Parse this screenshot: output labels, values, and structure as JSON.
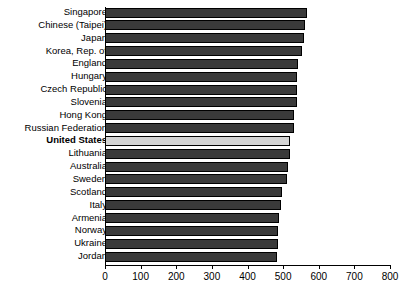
{
  "chart_data": {
    "type": "bar",
    "orientation": "horizontal",
    "title": "",
    "subtitle": "",
    "xlabel": "",
    "ylabel": "",
    "xlim": [
      0,
      800
    ],
    "xticks": [
      0,
      100,
      200,
      300,
      400,
      500,
      600,
      700,
      800
    ],
    "xtick_labels": [
      "0",
      "100",
      "200",
      "300",
      "400",
      "500",
      "600",
      "700",
      "800"
    ],
    "grid": false,
    "legend": null,
    "highlight_category": "United States",
    "colors": {
      "bar": "#3a3a3a",
      "bar_edge": "#000000",
      "highlight_bar": "#d4d4d4",
      "axis": "#000000",
      "background": "#ffffff"
    },
    "categories": [
      "Singapore",
      "Chinese (Taipei)",
      "Japan",
      "Korea, Rep. of",
      "England",
      "Hungary",
      "Czech Republic",
      "Slovenia",
      "Hong Kong",
      "Russian Federation",
      "United States",
      "Lithuania",
      "Australia",
      "Sweden",
      "Scotland",
      "Italy",
      "Armenia",
      "Norway",
      "Ukraine",
      "Jordan"
    ],
    "values": [
      567,
      561,
      558,
      553,
      542,
      539,
      539,
      538,
      530,
      530,
      520,
      519,
      515,
      511,
      496,
      495,
      488,
      487,
      485,
      482
    ]
  },
  "rows": [
    {
      "label": "Singapore",
      "value": 567,
      "highlight": false
    },
    {
      "label": "Chinese (Taipei)",
      "value": 561,
      "highlight": false
    },
    {
      "label": "Japan",
      "value": 558,
      "highlight": false
    },
    {
      "label": "Korea, Rep. of",
      "value": 553,
      "highlight": false
    },
    {
      "label": "England",
      "value": 542,
      "highlight": false
    },
    {
      "label": "Hungary",
      "value": 539,
      "highlight": false
    },
    {
      "label": "Czech Republic",
      "value": 539,
      "highlight": false
    },
    {
      "label": "Slovenia",
      "value": 538,
      "highlight": false
    },
    {
      "label": "Hong Kong",
      "value": 530,
      "highlight": false
    },
    {
      "label": "Russian Federation",
      "value": 530,
      "highlight": false
    },
    {
      "label": "United States",
      "value": 520,
      "highlight": true
    },
    {
      "label": "Lithuania",
      "value": 519,
      "highlight": false
    },
    {
      "label": "Australia",
      "value": 515,
      "highlight": false
    },
    {
      "label": "Sweden",
      "value": 511,
      "highlight": false
    },
    {
      "label": "Scotland",
      "value": 496,
      "highlight": false
    },
    {
      "label": "Italy",
      "value": 495,
      "highlight": false
    },
    {
      "label": "Armenia",
      "value": 488,
      "highlight": false
    },
    {
      "label": "Norway",
      "value": 487,
      "highlight": false
    },
    {
      "label": "Ukraine",
      "value": 485,
      "highlight": false
    },
    {
      "label": "Jordan",
      "value": 482,
      "highlight": false
    }
  ],
  "axis": {
    "ticks": [
      "0",
      "100",
      "200",
      "300",
      "400",
      "500",
      "600",
      "700",
      "800"
    ]
  }
}
